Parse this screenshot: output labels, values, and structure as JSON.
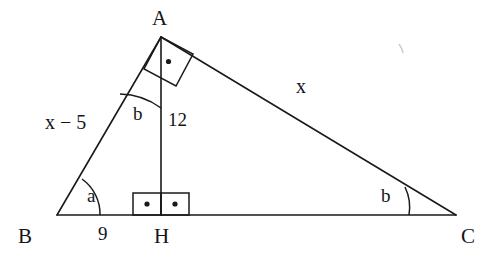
{
  "figure": {
    "kind": "geometry-diagram",
    "stroke_color": "#1a1a1a",
    "background_color": "#ffffff",
    "artifact_mark": "faint-scan-speck"
  },
  "vertices": {
    "A": {
      "label": "A",
      "x": 161,
      "y": 37,
      "label_x": 152,
      "label_y": 8
    },
    "B": {
      "label": "B",
      "x": 57,
      "y": 215,
      "label_x": 18,
      "label_y": 226
    },
    "C": {
      "label": "C",
      "x": 456,
      "y": 215,
      "label_x": 461,
      "label_y": 226
    },
    "H": {
      "label": "H",
      "x": 161,
      "y": 215,
      "label_x": 154,
      "label_y": 226
    }
  },
  "labels": {
    "side_ab": "x − 5",
    "side_ac": "x",
    "altitude": "12",
    "segment_bh": "9",
    "angle_at_b": "a",
    "angle_at_a": "b",
    "angle_at_c": "b"
  },
  "label_positions": {
    "side_ab": {
      "x": 45,
      "y": 112
    },
    "side_ac": {
      "x": 296,
      "y": 76
    },
    "altitude": {
      "x": 168,
      "y": 110
    },
    "segment_bh": {
      "x": 98,
      "y": 224
    },
    "angle_at_b": {
      "x": 87,
      "y": 186
    },
    "angle_at_a": {
      "x": 133,
      "y": 104
    },
    "angle_at_c": {
      "x": 381,
      "y": 186
    }
  },
  "markers": {
    "right_angle_at_a": "tilted-square-with-dot",
    "right_angle_at_h_left": "square-with-dot",
    "right_angle_at_h_right": "square-with-dot",
    "angle_arc_b": "single-arc",
    "angle_arc_a": "single-arc",
    "angle_arc_c": "single-arc"
  }
}
